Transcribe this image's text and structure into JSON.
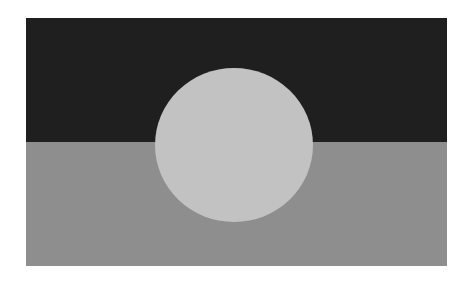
{
  "image": {
    "subject": "Aboriginal flag (grayscale)",
    "colors": {
      "top_band": "#1f1f1f",
      "bottom_band": "#8e8e8e",
      "disc": "#c2c2c2",
      "background": "#ffffff"
    }
  }
}
